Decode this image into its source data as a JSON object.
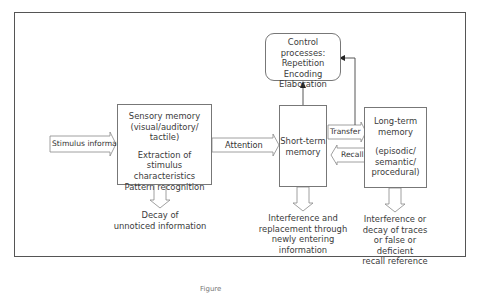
{
  "diagram": {
    "nodes": {
      "stimulus": {
        "label": "Stimulus information"
      },
      "sensory": {
        "title_lines": [
          "Sensory memory",
          "(visual/auditory/",
          "tactile)"
        ],
        "detail_lines": [
          "Extraction of",
          "stimulus characteristics",
          "Pattern recognition"
        ]
      },
      "short_term": {
        "lines": [
          "Short-term",
          "memory"
        ]
      },
      "control": {
        "lines": [
          "Control processes:",
          "Repetition",
          "Encoding",
          "Elaboration"
        ]
      },
      "long_term": {
        "title_lines": [
          "Long-term",
          "memory"
        ],
        "detail_lines": [
          "(episodic/",
          "semantic/",
          "procedural)"
        ]
      }
    },
    "edges": {
      "attention": "Attention",
      "transfer": "Transfer",
      "recall": "Recall"
    },
    "outcomes": {
      "sensory": [
        "Decay of",
        "unnoticed information"
      ],
      "short_term": [
        "Interference and",
        "replacement through",
        "newly entering",
        "information"
      ],
      "long_term": [
        "Interference or",
        "decay of traces",
        "or false or",
        "deficient",
        "recall reference"
      ]
    },
    "caption": "Figure"
  }
}
